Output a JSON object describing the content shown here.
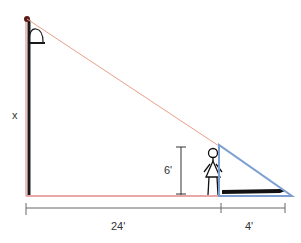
{
  "diagram": {
    "type": "similar-triangles-lamppost-shadow",
    "labels": {
      "lamp_height": "x",
      "person_height": "6'",
      "distance_to_person": "24'",
      "shadow_length": "4'"
    },
    "colors": {
      "light_ray": "#e8a08a",
      "ground_red": "#e8a8a8",
      "shadow_triangle": "#7b9fd1",
      "pole": "#1a1a1a",
      "dimension_line": "#555555",
      "shadow": "#111111"
    }
  }
}
